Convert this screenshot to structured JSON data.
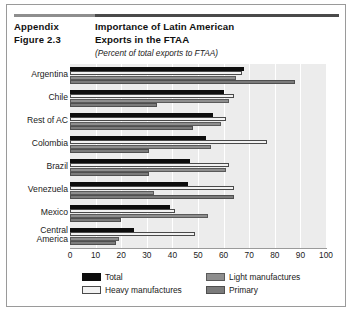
{
  "header": {
    "appendix_line1": "Appendix",
    "appendix_line2": "Figure 2.3",
    "title_line1": "Importance of Latin American",
    "title_line2": "Exports in the FTAA",
    "subtitle": "(Percent of total exports to FTAA)"
  },
  "chart_data": {
    "type": "bar",
    "orientation": "horizontal",
    "title": "Importance of Latin American Exports in the FTAA",
    "subtitle": "(Percent of total exports to FTAA)",
    "xlabel": "",
    "ylabel": "",
    "xlim": [
      0,
      100
    ],
    "xticks": [
      0,
      10,
      20,
      30,
      40,
      50,
      60,
      70,
      80,
      90,
      100
    ],
    "grid": true,
    "legend_position": "bottom",
    "categories": [
      "Argentina",
      "Chile",
      "Rest of AC",
      "Colombia",
      "Brazil",
      "Venezuela",
      "Mexico",
      "Central America"
    ],
    "series": [
      {
        "name": "Total",
        "color": "#0d0d0d",
        "values": [
          68,
          60,
          56,
          53,
          47,
          46,
          39,
          25
        ]
      },
      {
        "name": "Heavy manufactures",
        "color": "#f2f2f2",
        "values": [
          67,
          64,
          61,
          77,
          62,
          64,
          41,
          49
        ]
      },
      {
        "name": "Light manufactures",
        "color": "#8e8e8e",
        "values": [
          65,
          62,
          59,
          55,
          61,
          33,
          54,
          19
        ]
      },
      {
        "name": "Primary",
        "color": "#7b7b7b",
        "values": [
          88,
          34,
          48,
          31,
          31,
          64,
          20,
          18
        ]
      }
    ]
  },
  "legend": {
    "total": "Total",
    "heavy": "Heavy manufactures",
    "light": "Light manufactures",
    "primary": "Primary"
  }
}
